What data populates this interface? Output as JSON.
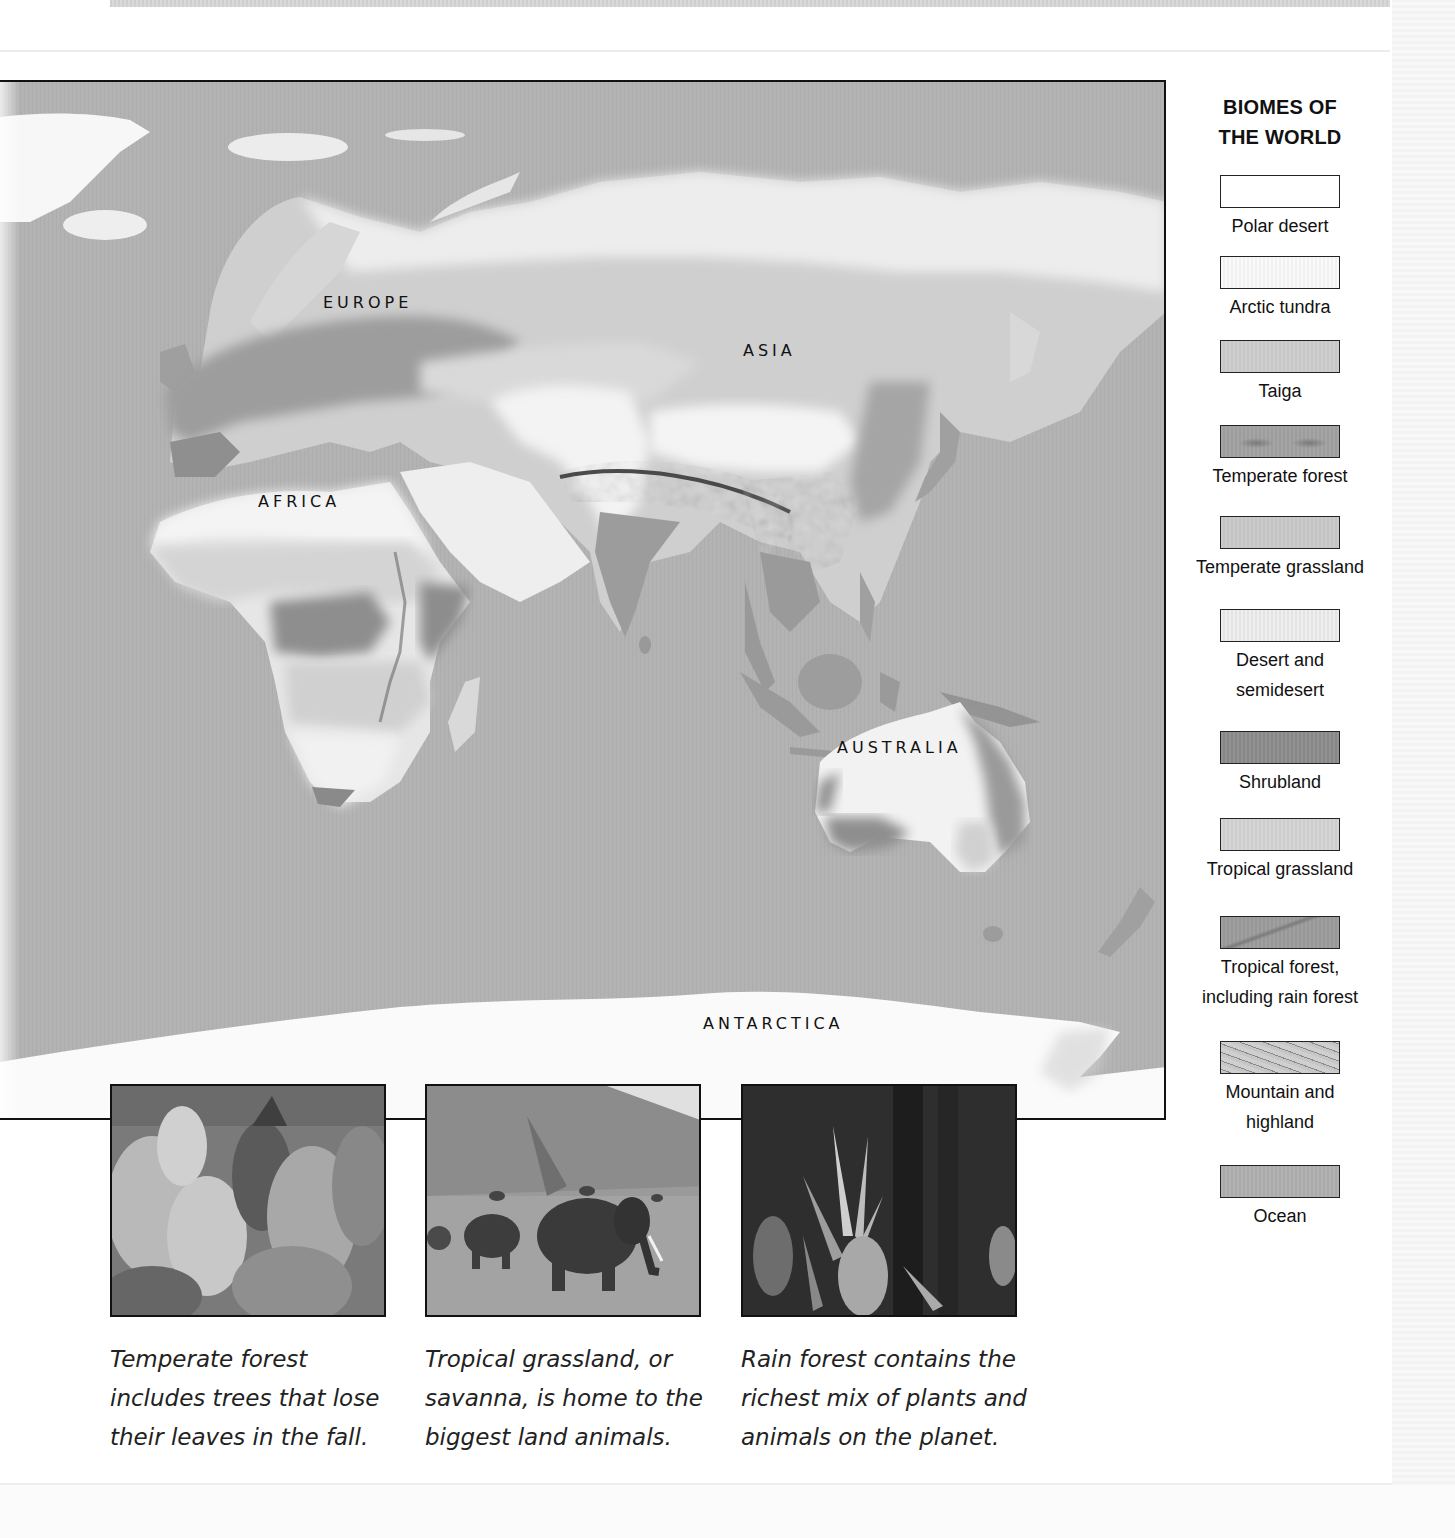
{
  "map": {
    "labels": {
      "europe": "EUROPE",
      "asia": "ASIA",
      "africa": "AFRICA",
      "australia": "AUSTRALIA",
      "antarctica": "ANTARCTICA"
    },
    "colors": {
      "ocean": "#b3b3b3",
      "polar_desert": "#fbfbfb",
      "arctic_tundra": "#f0f0f0",
      "taiga": "#cdcdcd",
      "temperate_forest": "#9a9a9a",
      "temperate_grassland": "#c6c6c6",
      "desert": "#ececec",
      "shrubland": "#8e8e8e",
      "tropical_grassland": "#d2d2d2",
      "tropical_forest": "#9c9c9c",
      "mountain": "#6f6f6f"
    }
  },
  "legend": {
    "title_line1": "BIOMES OF",
    "title_line2": "THE WORLD",
    "items": [
      {
        "label": "Polar desert",
        "label2": "",
        "color": "#ffffff",
        "pattern": "none"
      },
      {
        "label": "Arctic tundra",
        "label2": "",
        "color": "#f8f8f8",
        "pattern": "none"
      },
      {
        "label": "Taiga",
        "label2": "",
        "color": "#cdcdcd",
        "pattern": "speckle"
      },
      {
        "label": "Temperate forest",
        "label2": "",
        "color": "#a3a3a3",
        "pattern": "strokes"
      },
      {
        "label": "Temperate grassland",
        "label2": "",
        "color": "#c9c9c9",
        "pattern": "speckle"
      },
      {
        "label": "Desert and",
        "label2": "semidesert",
        "color": "#ededed",
        "pattern": "speckle"
      },
      {
        "label": "Shrubland",
        "label2": "",
        "color": "#8f8f8f",
        "pattern": "speckle"
      },
      {
        "label": "Tropical grassland",
        "label2": "",
        "color": "#d4d4d4",
        "pattern": "speckle"
      },
      {
        "label": "Tropical forest,",
        "label2": "including rain forest",
        "color": "#9e9e9e",
        "pattern": "strokes"
      },
      {
        "label": "Mountain and",
        "label2": "highland",
        "color": "#c4c4c4",
        "pattern": "dense-strokes"
      },
      {
        "label": "Ocean",
        "label2": "",
        "color": "#b0b0b0",
        "pattern": "none"
      }
    ]
  },
  "photos": [
    {
      "subject": "temperate-forest",
      "caption_line1": "Temperate forest",
      "caption_line2": "includes trees that lose",
      "caption_line3": "their leaves in the fall."
    },
    {
      "subject": "savanna-elephants",
      "caption_line1": "Tropical grassland, or",
      "caption_line2": "savanna, is home to the",
      "caption_line3": "biggest land animals."
    },
    {
      "subject": "rain-forest",
      "caption_line1": "Rain forest contains the",
      "caption_line2": "richest mix of plants and",
      "caption_line3": "animals on the planet."
    }
  ]
}
